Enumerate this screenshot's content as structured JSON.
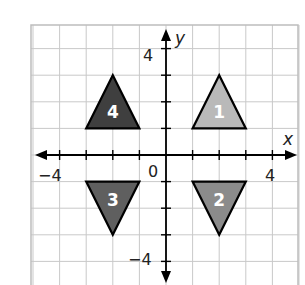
{
  "figure": {
    "type": "coordinate-plane",
    "x_axis": {
      "label": "x",
      "range": [
        -5,
        5
      ],
      "tick_labels": [
        {
          "value": -4,
          "text": "−4"
        },
        {
          "value": 4,
          "text": "4"
        }
      ]
    },
    "y_axis": {
      "label": "y",
      "range": [
        -4.8,
        5
      ],
      "tick_labels": [
        {
          "value": 4,
          "text": "4"
        },
        {
          "value": -4,
          "text": "−4"
        }
      ]
    },
    "origin_label": "0",
    "grid": true,
    "triangles": [
      {
        "id": "1",
        "label": "1",
        "quadrant": "I",
        "vertices": [
          [
            1,
            1
          ],
          [
            3,
            1
          ],
          [
            2,
            3
          ]
        ],
        "fill": "#b9b9b9"
      },
      {
        "id": "2",
        "label": "2",
        "quadrant": "IV",
        "vertices": [
          [
            1,
            -1
          ],
          [
            3,
            -1
          ],
          [
            2,
            -3
          ]
        ],
        "fill": "#8b8b8b"
      },
      {
        "id": "3",
        "label": "3",
        "quadrant": "III",
        "vertices": [
          [
            -3,
            -1
          ],
          [
            -1,
            -1
          ],
          [
            -2,
            -3
          ]
        ],
        "fill": "#5f5f5f"
      },
      {
        "id": "4",
        "label": "4",
        "quadrant": "II",
        "vertices": [
          [
            -3,
            1
          ],
          [
            -1,
            1
          ],
          [
            -2,
            3
          ]
        ],
        "fill": "#3f3f3f"
      }
    ]
  }
}
